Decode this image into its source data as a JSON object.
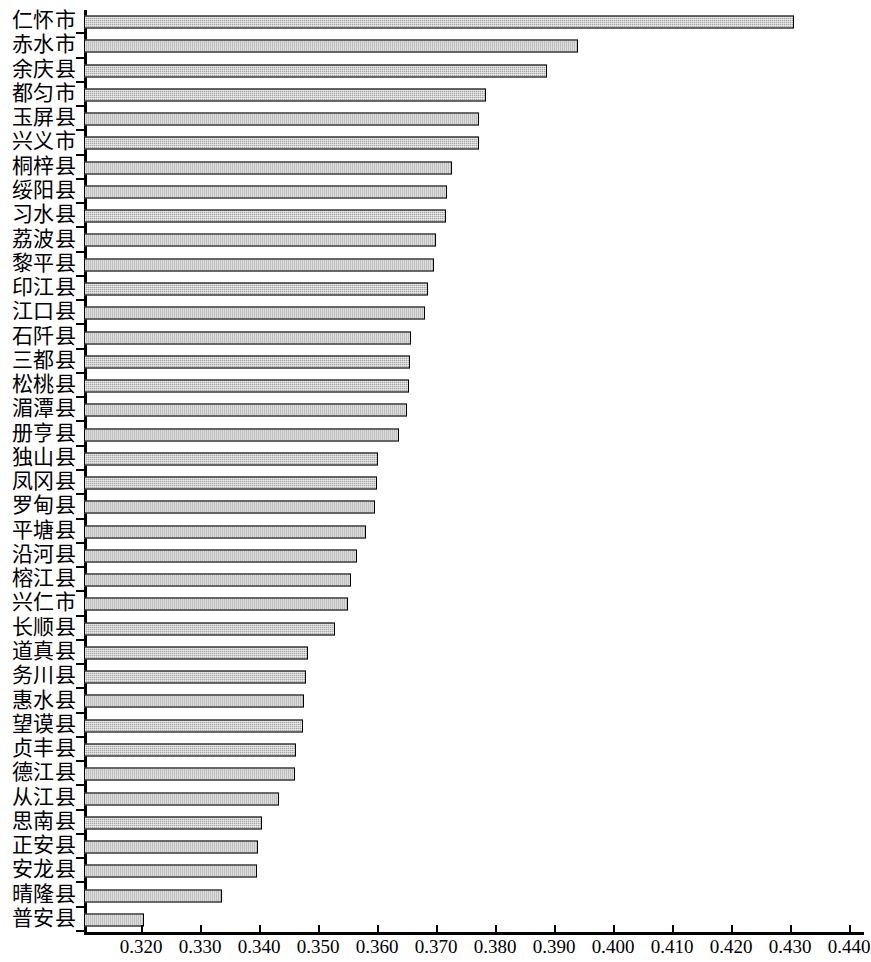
{
  "chart_data": {
    "type": "bar",
    "orientation": "horizontal",
    "title": "",
    "xlabel": "",
    "ylabel": "",
    "xlim": [
      0.3103,
      0.4425
    ],
    "grid": false,
    "legend": null,
    "axis": {
      "tick_values": [
        0.32,
        0.33,
        0.34,
        0.35,
        0.36,
        0.37,
        0.38,
        0.39,
        0.4,
        0.41,
        0.42,
        0.43,
        0.44
      ],
      "tick_labels": [
        "0.320",
        "0.330",
        "0.340",
        "0.350",
        "0.360",
        "0.370",
        "0.380",
        "0.390",
        "0.400",
        "0.410",
        "0.420",
        "0.430",
        "0.440"
      ]
    },
    "categories": [
      "仁怀市",
      "赤水市",
      "余庆县",
      "都匀市",
      "玉屏县",
      "兴义市",
      "桐梓县",
      "绥阳县",
      "习水县",
      "荔波县",
      "黎平县",
      "印江县",
      "江口县",
      "石阡县",
      "三都县",
      "松桃县",
      "湄潭县",
      "册亨县",
      "独山县",
      "凤冈县",
      "罗甸县",
      "平塘县",
      "沿河县",
      "榕江县",
      "兴仁市",
      "长顺县",
      "道真县",
      "务川县",
      "惠水县",
      "望谟县",
      "贞丰县",
      "德江县",
      "从江县",
      "思南县",
      "正安县",
      "安龙县",
      "晴隆县",
      "普安县"
    ],
    "values": [
      0.4306,
      0.3941,
      0.3887,
      0.3784,
      0.3773,
      0.3772,
      0.3727,
      0.3719,
      0.3716,
      0.37,
      0.3697,
      0.3686,
      0.3681,
      0.3658,
      0.3655,
      0.3653,
      0.3651,
      0.3637,
      0.3601,
      0.3599,
      0.3597,
      0.3581,
      0.3566,
      0.3556,
      0.3551,
      0.3528,
      0.3482,
      0.3479,
      0.3476,
      0.3474,
      0.3462,
      0.3461,
      0.3434,
      0.3404,
      0.3398,
      0.3397,
      0.3337,
      0.3205
    ],
    "bar_style": {
      "fill": "#a8a8a8",
      "edge": "#000000",
      "hatch": "dotted-fine"
    }
  }
}
